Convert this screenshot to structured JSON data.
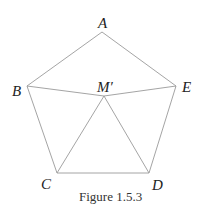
{
  "figure": {
    "caption": "Figure 1.5.3",
    "vertices": {
      "A": {
        "label": "A",
        "x": 102,
        "y": 32
      },
      "B": {
        "label": "B",
        "x": 27,
        "y": 86
      },
      "C": {
        "label": "C",
        "x": 57,
        "y": 173
      },
      "D": {
        "label": "D",
        "x": 149,
        "y": 173
      },
      "E": {
        "label": "E",
        "x": 176,
        "y": 86
      },
      "M": {
        "label": "M′",
        "x": 104,
        "y": 96
      }
    },
    "edges": [
      [
        "A",
        "B"
      ],
      [
        "B",
        "C"
      ],
      [
        "C",
        "D"
      ],
      [
        "D",
        "E"
      ],
      [
        "E",
        "A"
      ],
      [
        "B",
        "M"
      ],
      [
        "M",
        "E"
      ],
      [
        "M",
        "C"
      ],
      [
        "M",
        "D"
      ]
    ],
    "colors": {
      "line": "#9a9a9a",
      "text": "#222222"
    }
  }
}
